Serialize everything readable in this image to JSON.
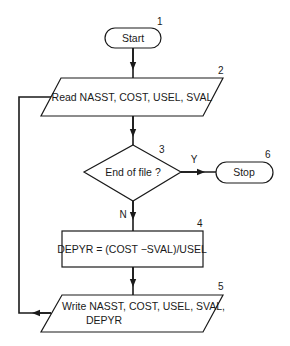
{
  "diagram": {
    "type": "flowchart",
    "nodes": [
      {
        "id": "1",
        "number": "1",
        "shape": "terminal",
        "label": "Start"
      },
      {
        "id": "2",
        "number": "2",
        "shape": "input-output",
        "label": "Read NASST, COST, USEL, SVAL"
      },
      {
        "id": "3",
        "number": "3",
        "shape": "decision",
        "label": "End of file ?"
      },
      {
        "id": "4",
        "number": "4",
        "shape": "process",
        "label": "DEPYR = (COST −SVAL)/USEL"
      },
      {
        "id": "5",
        "number": "5",
        "shape": "input-output",
        "label_line1": "Write NASST, COST, USEL, SVAL,",
        "label_line2": "DEPYR"
      },
      {
        "id": "6",
        "number": "6",
        "shape": "terminal",
        "label": "Stop"
      }
    ],
    "edges": [
      {
        "from": "1",
        "to": "2",
        "label": ""
      },
      {
        "from": "2",
        "to": "3",
        "label": ""
      },
      {
        "from": "3",
        "to": "6",
        "label": "Y"
      },
      {
        "from": "3",
        "to": "4",
        "label": "N"
      },
      {
        "from": "4",
        "to": "5",
        "label": ""
      },
      {
        "from": "5",
        "to": "2",
        "label": ""
      }
    ]
  }
}
